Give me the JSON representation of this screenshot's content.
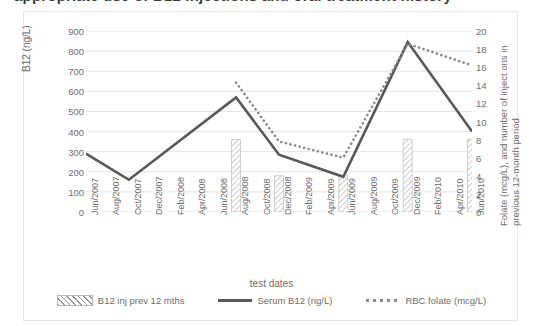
{
  "title": "appropriate use of B12 injections and oral treatment history",
  "axes": {
    "x_title": "test dates",
    "y_left_title": "B12 (ng/L)",
    "y_right_title": "Folate (mcg/L), and number of inject ons in previous 12-month period",
    "y_left_ticks": [
      "900",
      "800",
      "700",
      "600",
      "500",
      "400",
      "300",
      "200",
      "100",
      "0"
    ],
    "y_right_ticks": [
      "20",
      "18",
      "16",
      "14",
      "12",
      "10",
      "8",
      "6",
      "4",
      "2",
      "0"
    ]
  },
  "legend": {
    "items": [
      {
        "label": "B12 inj prev 12 mths",
        "marker": "hatched-bar-swatch",
        "color": "#9a9a9a"
      },
      {
        "label": "Serum B12 (ng/L)",
        "marker": "solid-line-swatch",
        "color": "#595959"
      },
      {
        "label": "RBC folate (mcg/L)",
        "marker": "dotted-line-swatch",
        "color": "#8a8a8a"
      }
    ]
  },
  "chart_data": {
    "type": "line",
    "title": "appropriate use of B12 injections and oral treatment history",
    "xlabel": "test dates",
    "ylabel": "B12 (ng/L)",
    "y2label": "Folate (mcg/L), and number of inject ons in previous 12-month period",
    "ylim": [
      0,
      900
    ],
    "y2lim": [
      0,
      20
    ],
    "grid": true,
    "legend_position": "bottom",
    "categories": [
      "Jun/2007",
      "Aug/2007",
      "Oct/2007",
      "Dec/2007",
      "Feb/2008",
      "Apr/2008",
      "Jun/2008",
      "Aug/2008",
      "Oct/2008",
      "Dec/2008",
      "Feb/2009",
      "Apr/2009",
      "Jun/2009",
      "Aug/2009",
      "Oct/2009",
      "Dec/2009",
      "Feb/2010",
      "Apr/2010",
      "Jun/2010"
    ],
    "series": [
      {
        "name": "B12 inj prev 12 mths",
        "type": "bar",
        "axis": "right",
        "color": "#9a9a9a",
        "values": [
          null,
          null,
          null,
          null,
          null,
          null,
          null,
          8,
          null,
          4,
          null,
          null,
          4,
          null,
          null,
          8,
          null,
          null,
          8
        ]
      },
      {
        "name": "Serum B12 (ng/L)",
        "type": "line",
        "axis": "left",
        "color": "#595959",
        "values": [
          290,
          null,
          160,
          null,
          null,
          null,
          null,
          570,
          null,
          285,
          null,
          null,
          175,
          null,
          null,
          845,
          null,
          null,
          400
        ]
      },
      {
        "name": "RBC folate (mcg/L)",
        "type": "line",
        "axis": "right",
        "color": "#8a8a8a",
        "values": [
          null,
          null,
          null,
          null,
          null,
          null,
          null,
          14.3,
          null,
          7.8,
          null,
          null,
          6.0,
          null,
          null,
          18.6,
          null,
          null,
          16.2
        ]
      }
    ]
  }
}
